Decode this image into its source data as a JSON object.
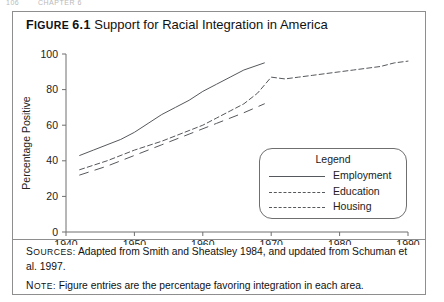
{
  "page_header": {
    "number": "106",
    "running_title": "CHAPTER 6"
  },
  "figure": {
    "label_prefix": "F",
    "label_rest": "IGURE",
    "label_number": "6.1",
    "title": "Support for Racial Integration in America"
  },
  "legend": {
    "title": "Legend",
    "entries": [
      {
        "label": "Employment",
        "style": "solid"
      },
      {
        "label": "Education",
        "style": "dotted"
      },
      {
        "label": "Housing",
        "style": "dashed"
      }
    ]
  },
  "notes": [
    {
      "kicker_cap": "S",
      "kicker_rest": "ources:",
      "text": "Adapted from Smith and Sheatsley 1984, and updated from Schuman et al. 1997."
    },
    {
      "kicker_cap": "N",
      "kicker_rest": "ote:",
      "text": "Figure entries are the percentage favoring integration in each area."
    }
  ],
  "chart_data": {
    "type": "line",
    "title": "Support for Racial Integration in America",
    "xlabel": "",
    "ylabel": "Percentage Positive",
    "xlim": [
      1940,
      1990
    ],
    "ylim": [
      0,
      100
    ],
    "xticks": [
      1940,
      1950,
      1960,
      1970,
      1980,
      1990
    ],
    "yticks": [
      0,
      20,
      40,
      60,
      80,
      100
    ],
    "grid": false,
    "legend_position": "inside-lower-right",
    "series": [
      {
        "name": "Employment",
        "style": "solid",
        "x": [
          1942,
          1944,
          1946,
          1948,
          1950,
          1952,
          1954,
          1956,
          1958,
          1960,
          1962,
          1964,
          1966,
          1969
        ],
        "y": [
          43,
          46,
          49,
          52,
          56,
          61,
          66,
          70,
          74,
          79,
          83,
          87,
          91,
          95
        ]
      },
      {
        "name": "Education",
        "style": "dotted",
        "x": [
          1942,
          1946,
          1950,
          1954,
          1956,
          1958,
          1960,
          1962,
          1964,
          1966,
          1968,
          1970,
          1972,
          1974,
          1976,
          1978,
          1980,
          1982,
          1984,
          1986,
          1988,
          1990
        ],
        "y": [
          35,
          40,
          46,
          51,
          54,
          57,
          60,
          64,
          68,
          72,
          78,
          87,
          86,
          87,
          88,
          89,
          90,
          91,
          92,
          93,
          95,
          96
        ]
      },
      {
        "name": "Housing",
        "style": "dashed",
        "x": [
          1942,
          1946,
          1950,
          1954,
          1958,
          1962,
          1966,
          1969
        ],
        "y": [
          32,
          37,
          43,
          49,
          55,
          61,
          67,
          72
        ]
      }
    ]
  }
}
